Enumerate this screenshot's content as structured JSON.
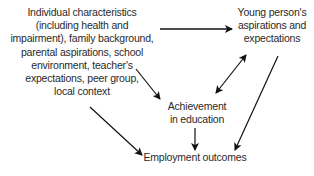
{
  "diagram": {
    "nodes": [
      {
        "id": "individual",
        "lines": [
          "Individual characteristics",
          "(including health and",
          "impairment), family background,",
          "parental aspirations, school",
          "environment, teacher's",
          "expectations, peer group,",
          "local context"
        ]
      },
      {
        "id": "young",
        "lines": [
          "Young person's",
          "aspirations and",
          "expectations"
        ]
      },
      {
        "id": "achievement",
        "lines": [
          "Achievement",
          "in education"
        ]
      },
      {
        "id": "employment",
        "lines": [
          "Employment outcomes"
        ]
      }
    ],
    "edges": [
      {
        "from": "individual",
        "to": "young",
        "type": "single"
      },
      {
        "from": "individual",
        "to": "achievement",
        "type": "single"
      },
      {
        "from": "individual",
        "to": "employment",
        "type": "single"
      },
      {
        "from": "young",
        "to": "achievement",
        "type": "double"
      },
      {
        "from": "young",
        "to": "employment",
        "type": "single"
      },
      {
        "from": "achievement",
        "to": "employment",
        "type": "single"
      }
    ],
    "colors": {
      "text": "#2a2a2a",
      "arrow": "#111111",
      "background": "#ffffff"
    }
  }
}
